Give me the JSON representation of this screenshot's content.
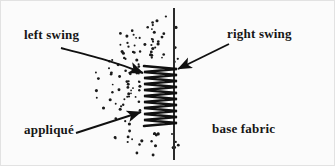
{
  "figure": {
    "background_color": "#fbfbfb",
    "ink_color": "#161616",
    "frame_color": "#d8d8d8"
  },
  "labels": {
    "left_swing": "left  swing",
    "right_swing": "right swing",
    "applique": "appliqué",
    "base_fabric": "base fabric"
  },
  "elements": {
    "fabric_edge_line": {
      "name": "base-fabric-edge-line",
      "x": 174,
      "y_top": 8,
      "y_bottom": 160
    },
    "zigzag_stitch": {
      "name": "zigzag-stitch-path",
      "x_left": 144,
      "x_right": 177,
      "y_top": 66,
      "y_bottom": 126,
      "cycles": 10
    },
    "stipple_region": {
      "name": "applique-stipple-texture",
      "x_min": 84,
      "x_max": 180,
      "y_min": 14,
      "y_max": 158,
      "dot_count": 120
    }
  },
  "arrows": {
    "left_swing_arrow": {
      "name": "left-swing-arrow",
      "style": "curved",
      "from": [
        61,
        48
      ],
      "to": [
        146,
        74
      ]
    },
    "right_swing_arrow": {
      "name": "right-swing-arrow",
      "style": "straight",
      "from": [
        229,
        44
      ],
      "to": [
        176,
        70
      ]
    },
    "applique_arrow": {
      "name": "applique-arrow",
      "style": "straight",
      "from": [
        76,
        133
      ],
      "to": [
        143,
        112
      ]
    }
  }
}
